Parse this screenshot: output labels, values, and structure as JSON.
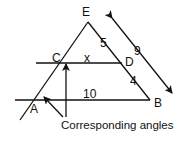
{
  "diagram": {
    "type": "geometry-similar-triangles",
    "points": {
      "E": {
        "label": "E"
      },
      "C": {
        "label": "C"
      },
      "D": {
        "label": "D"
      },
      "A": {
        "label": "A"
      },
      "B": {
        "label": "B"
      }
    },
    "segment_labels": {
      "ED": "5",
      "CD": "x",
      "DB": "4",
      "AB": "10",
      "EB": "9"
    },
    "caption": "Corresponding angles",
    "colors": {
      "stroke": "#111111",
      "background": "#ffffff"
    }
  }
}
